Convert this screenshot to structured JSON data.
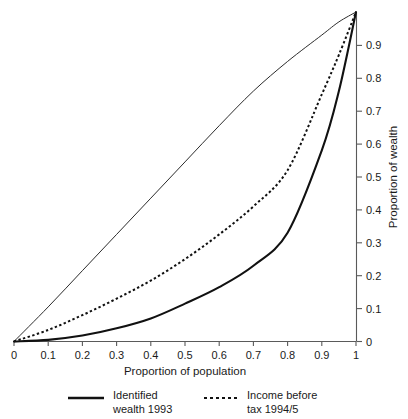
{
  "chart_data": {
    "type": "line",
    "title": "",
    "xlabel": "Proportion of population",
    "ylabel": "Proportion of wealth",
    "xlim": [
      0,
      1
    ],
    "ylim": [
      0,
      1
    ],
    "grid": false,
    "legend_position": "bottom",
    "xticks": [
      "0",
      "0.1",
      "0.2",
      "0.3",
      "0.4",
      "0.5",
      "0.6",
      "0.7",
      "0.8",
      "0.9",
      "1"
    ],
    "xtick_values": [
      0,
      0.1,
      0.2,
      0.3,
      0.4,
      0.5,
      0.6,
      0.7,
      0.8,
      0.9,
      1
    ],
    "yticks": [
      "0",
      "0.1",
      "0.2",
      "0.3",
      "0.4",
      "0.5",
      "0.6",
      "0.7",
      "0.8",
      "0.9"
    ],
    "ytick_values": [
      0,
      0.1,
      0.2,
      0.3,
      0.4,
      0.5,
      0.6,
      0.7,
      0.8,
      0.9
    ],
    "y_axis_side": "right",
    "x": [
      0,
      0.1,
      0.2,
      0.3,
      0.4,
      0.5,
      0.6,
      0.7,
      0.8,
      0.9,
      0.95,
      1
    ],
    "series": [
      {
        "name": "equality-reference",
        "style": "thin-solid",
        "in_legend": false,
        "values": [
          0,
          0.105,
          0.215,
          0.325,
          0.435,
          0.545,
          0.655,
          0.76,
          0.85,
          0.93,
          0.97,
          1
        ]
      },
      {
        "name": "Income before tax 1994/5",
        "style": "dashed",
        "in_legend": true,
        "values": [
          0,
          0.035,
          0.08,
          0.13,
          0.185,
          0.25,
          0.325,
          0.41,
          0.52,
          0.75,
          0.87,
          1
        ]
      },
      {
        "name": "Identified wealth 1993",
        "style": "solid",
        "in_legend": true,
        "values": [
          0,
          0.005,
          0.018,
          0.04,
          0.07,
          0.115,
          0.165,
          0.23,
          0.33,
          0.58,
          0.76,
          1
        ]
      }
    ]
  },
  "legend": {
    "items": [
      {
        "line1": "Identified",
        "line2": "wealth 1993",
        "style": "solid"
      },
      {
        "line1": "Income before",
        "line2": "tax 1994/5",
        "style": "dashed"
      }
    ]
  },
  "colors": {
    "curve": "#111111",
    "axis": "#5a5a5a",
    "background": "#ffffff"
  }
}
